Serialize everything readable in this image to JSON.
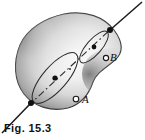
{
  "figure": {
    "caption": "Fig. 15.3",
    "body_shape": "irregular kidney-shaped rigid body with shaded 3D surface",
    "axis": {
      "name": "axis-of-rotation",
      "style": "dash-dot inside body, solid outside",
      "direction": "lower-left to upper-right diagonal",
      "start": "bottom-left outside body",
      "end": "top-right outside body"
    },
    "labels": {
      "point_a": "A",
      "point_b": "B"
    },
    "markers": {
      "axis_entry_dot": "filled black dot where axis pierces lower-left surface",
      "axis_exit_dot": "filled black dot where axis pierces upper-right surface",
      "circle_a_center": "filled dot at center of lower circular path",
      "circle_b_center": "filled dot at center of upper circular path",
      "point_a_marker": "open circle on lower circular path",
      "point_b_marker": "open circle on upper circular path",
      "mid_axis_dot": "small dot on axis between the two circular paths"
    },
    "paths": {
      "lower_circle": "large tilted ellipse representing circular path of point A",
      "upper_circle": "smaller tilted ellipse representing circular path of point B"
    },
    "colors": {
      "ink": "#111111",
      "outline": "#3a3a3a",
      "body_light": "#f4f4f4",
      "body_mid": "#c9c9c9",
      "body_dark": "#6e6e6e",
      "background": "#ffffff"
    }
  }
}
